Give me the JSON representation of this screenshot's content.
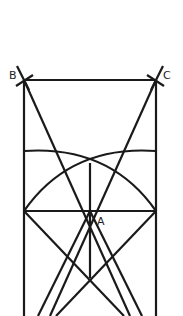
{
  "diagram": {
    "type": "geometric-construction",
    "points": [
      {
        "label": "B",
        "x": 24,
        "y": 80
      },
      {
        "label": "C",
        "x": 156,
        "y": 80
      },
      {
        "label": "A",
        "x": 90,
        "y": 211
      }
    ],
    "colors": {
      "stroke": "#1a1a1a",
      "background": "#ffffff"
    }
  },
  "labels": {
    "b": "B",
    "c": "C",
    "a": "A"
  }
}
